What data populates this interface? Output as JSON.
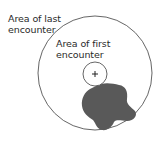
{
  "diagram": {
    "labels": {
      "last_encounter": {
        "line1": "Area of last",
        "line2": "encounter"
      },
      "first_encounter": {
        "line1": "Area of first",
        "line2": "encounter"
      }
    },
    "center_marker": "+",
    "shapes": {
      "outer_circle": {
        "cx": 95,
        "cy": 73,
        "r": 57,
        "stroke": "#555555"
      },
      "inner_circle": {
        "cx": 95,
        "cy": 74,
        "r": 12,
        "stroke": "#555555"
      },
      "blob": {
        "fill": "#595959"
      }
    }
  }
}
